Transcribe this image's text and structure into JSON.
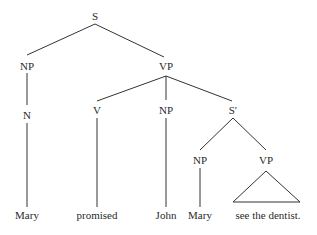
{
  "tree": {
    "nodes": {
      "root": "S",
      "subject_np": "NP",
      "subject_n": "N",
      "vp": "VP",
      "verb": "V",
      "object_np": "NP",
      "s_bar": "S′",
      "embedded_np": "NP",
      "embedded_vp": "VP"
    },
    "leaves": {
      "subject": "Mary",
      "verb": "promised",
      "object": "John",
      "embedded_subject": "Mary",
      "embedded_predicate": "see the dentist."
    }
  }
}
